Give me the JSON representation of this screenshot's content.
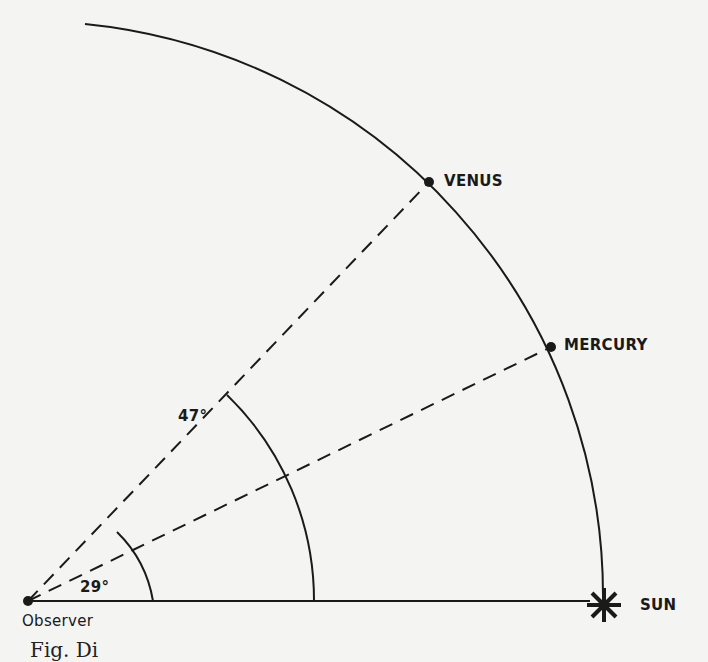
{
  "diagram": {
    "observer": {
      "label": "Observer",
      "x": 28,
      "y": 601
    },
    "sun": {
      "label": "SUN",
      "x": 603,
      "y": 601
    },
    "planets": [
      {
        "label": "VENUS",
        "angle_deg": 47,
        "x": 429,
        "y": 182
      },
      {
        "label": "MERCURY",
        "angle_deg": 29,
        "x": 551,
        "y": 347
      }
    ],
    "angles": [
      {
        "label": "47°",
        "arc_radius": 286
      },
      {
        "label": "29°",
        "arc_radius": 125
      }
    ],
    "orbit_radius": 575,
    "caption": "Fig.    Di"
  },
  "colors": {
    "ink": "#1a1a1a",
    "paper": "#f4f4f2"
  }
}
